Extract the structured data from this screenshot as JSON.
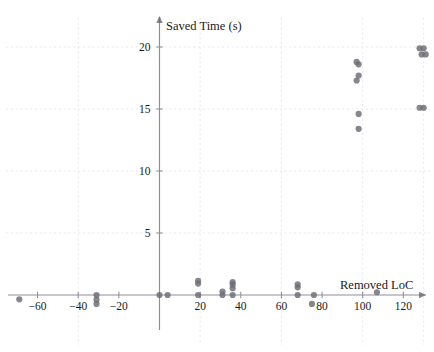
{
  "chart": {
    "type": "scatter",
    "title": "",
    "xlabel": "Removed LoC",
    "ylabel": "Saved Time (s)",
    "marker_color": "#6b6b74",
    "grid": true,
    "legend": "none"
  },
  "chart_data": {
    "type": "scatter",
    "title": "",
    "xlabel": "Removed LoC",
    "ylabel": "Saved Time (s)",
    "xlim": [
      -72,
      136
    ],
    "ylim": [
      -1.6,
      21.5
    ],
    "xticks": [
      -60,
      -40,
      -20,
      20,
      40,
      60,
      80,
      100,
      120
    ],
    "xtick_labels": [
      "−60",
      "−40",
      "−20",
      "20",
      "40",
      "60",
      "80",
      "100",
      "120"
    ],
    "yticks": [
      5,
      10,
      15,
      20
    ],
    "ytick_labels": [
      "5",
      "10",
      "15",
      "20"
    ],
    "grid": true,
    "gridlines_x": [
      -40,
      20,
      60,
      100,
      130
    ],
    "gridlines_y": [
      5,
      10,
      15,
      20
    ],
    "legend": "none",
    "series": [
      {
        "name": "samples",
        "points": [
          [
            -69,
            -0.35
          ],
          [
            -31,
            0.0
          ],
          [
            -31,
            -0.38
          ],
          [
            -31,
            -0.72
          ],
          [
            0,
            0.0
          ],
          [
            4,
            0.0
          ],
          [
            19,
            0.0
          ],
          [
            19,
            0.92
          ],
          [
            19,
            1.15
          ],
          [
            31,
            0.0
          ],
          [
            31,
            0.28
          ],
          [
            36,
            0.0
          ],
          [
            36,
            0.55
          ],
          [
            36,
            0.85
          ],
          [
            36,
            1.05
          ],
          [
            68,
            0.0
          ],
          [
            68,
            0.62
          ],
          [
            68,
            0.85
          ],
          [
            76,
            0.0
          ],
          [
            75,
            -0.72
          ],
          [
            97,
            18.8
          ],
          [
            98,
            18.6
          ],
          [
            97,
            17.3
          ],
          [
            98,
            17.7
          ],
          [
            98,
            14.6
          ],
          [
            98,
            13.4
          ],
          [
            107,
            0.22
          ],
          [
            128,
            19.9
          ],
          [
            130,
            19.9
          ],
          [
            129,
            19.4
          ],
          [
            131,
            19.4
          ],
          [
            128,
            15.1
          ],
          [
            130,
            15.1
          ]
        ]
      }
    ]
  }
}
